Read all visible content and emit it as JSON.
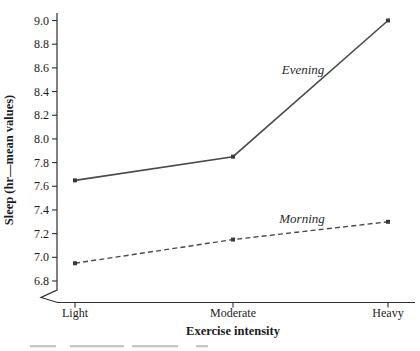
{
  "chart_data": {
    "type": "line",
    "categories": [
      "Light",
      "Moderate",
      "Heavy"
    ],
    "series": [
      {
        "name": "Evening",
        "values": [
          7.65,
          7.85,
          9.0
        ],
        "line_style": "solid"
      },
      {
        "name": "Morning",
        "values": [
          6.95,
          7.15,
          7.3
        ],
        "line_style": "dashed"
      }
    ],
    "xlabel": "Exercise intensity",
    "ylabel": "Sleep (hr—mean values)",
    "ylim": [
      6.8,
      9.0
    ],
    "y_tick_labels": [
      "9.0",
      "8.8",
      "8.6",
      "8.4",
      "8.2",
      "8.0",
      "7.8",
      "7.6",
      "7.4",
      "7.2",
      "7.0",
      "6.8"
    ],
    "axis_break_below_ymin": true,
    "grid": false,
    "legend_position": "inline-annotations",
    "colors": {
      "line": "#4a4a4a",
      "marker": "#3a3a3a",
      "axis": "#2e2e2e",
      "text": "#1c1c1c"
    }
  }
}
